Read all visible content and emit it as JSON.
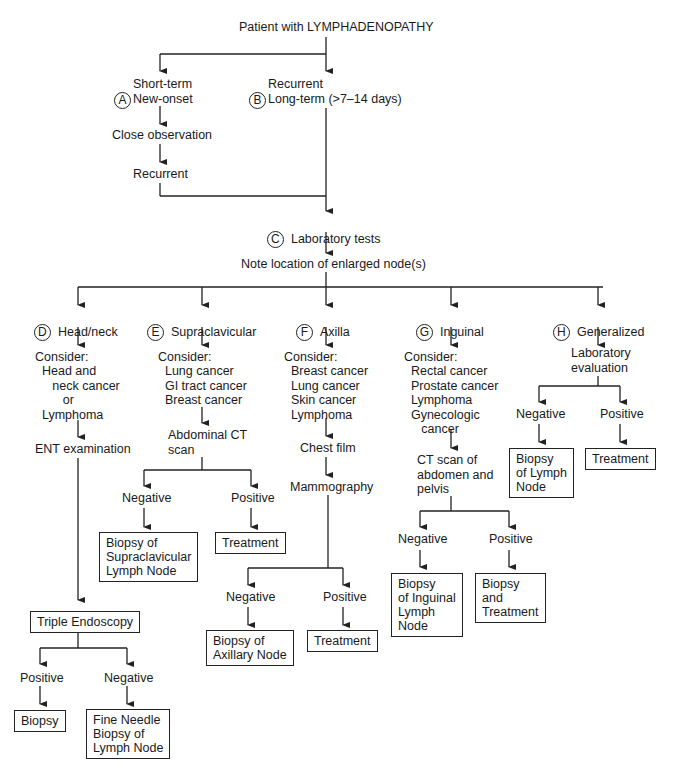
{
  "title": "Patient with LYMPHADENOPATHY",
  "branch_a": {
    "letter": "A",
    "label": "Short-term\nNew-onset",
    "step1": "Close observation",
    "step2": "Recurrent"
  },
  "branch_b": {
    "letter": "B",
    "label": "Recurrent\nLong-term (>7–14 days)"
  },
  "step_c": {
    "letter": "C",
    "label": "Laboratory tests"
  },
  "note_location": "Note location of enlarged node(s)",
  "columns": [
    {
      "letter": "D",
      "label": "Head/neck",
      "consider": "Consider:",
      "items": "  Head and\n     neck cancer\n        or\n  Lymphoma",
      "step": "ENT examination",
      "box": "Triple Endoscopy",
      "pos_label": "Positive",
      "pos_box": "Biopsy",
      "neg_label": "Negative",
      "neg_box": "Fine Needle\nBiopsy of\nLymph Node"
    },
    {
      "letter": "E",
      "label": "Supraclavicular",
      "consider": "Consider:",
      "items": "  Lung cancer\n  GI tract cancer\n  Breast cancer",
      "step": "Abdominal CT\nscan",
      "neg_label": "Negative",
      "neg_box": "Biopsy of\nSupraclavicular\nLymph Node",
      "pos_label": "Positive",
      "pos_box": "Treatment"
    },
    {
      "letter": "F",
      "label": "Axilla",
      "consider": "Consider:",
      "items": "  Breast cancer\n  Lung cancer\n  Skin cancer\n  Lymphoma",
      "step1": "Chest film",
      "step2": "Mammography",
      "neg_label": "Negative",
      "neg_box": "Biopsy of\nAxillary Node",
      "pos_label": "Positive",
      "pos_box": "Treatment"
    },
    {
      "letter": "G",
      "label": "Inguinal",
      "consider": "Consider:",
      "items": "  Rectal cancer\n  Prostate cancer\n  Lymphoma\n  Gynecologic\n     cancer",
      "step": "CT scan of\nabdomen and\npelvis",
      "neg_label": "Negative",
      "neg_box": "Biopsy\nof Inguinal\nLymph\nNode",
      "pos_label": "Positive",
      "pos_box": "Biopsy\nand\nTreatment"
    },
    {
      "letter": "H",
      "label": "Generalized",
      "step": "Laboratory\nevaluation",
      "neg_label": "Negative",
      "neg_box": "Biopsy\nof Lymph\nNode",
      "pos_label": "Positive",
      "pos_box": "Treatment"
    }
  ],
  "colors": {
    "line": "#222222",
    "text": "#1a1a1a",
    "background": "#ffffff"
  }
}
